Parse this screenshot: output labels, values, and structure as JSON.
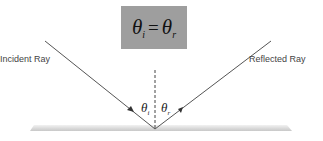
{
  "formula": {
    "lhs_symbol": "θ",
    "lhs_subscript": "i",
    "operator": "=",
    "rhs_symbol": "θ",
    "rhs_subscript": "r"
  },
  "labels": {
    "incident": "Incident Ray",
    "reflected": "Reflected Ray"
  },
  "angles": {
    "incident": {
      "symbol": "θ",
      "subscript": "i"
    },
    "reflected": {
      "symbol": "θ",
      "subscript": "r"
    }
  },
  "colors": {
    "formula_box": "#9e9e9e",
    "ray": "#555555",
    "mirror": "#d9d9d9",
    "text": "#444444"
  }
}
